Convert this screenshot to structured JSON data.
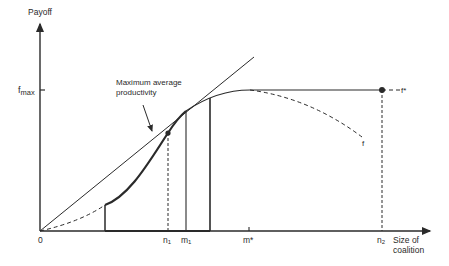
{
  "diagram": {
    "y_axis_label": "Payoff",
    "x_axis_label_line1": "Size of",
    "x_axis_label_line2": "coalition",
    "origin_label": "0",
    "fmax_label": "f",
    "fmax_sub": "max",
    "annotation_line1": "Maximum average",
    "annotation_line2": "productivity",
    "curve_f_label": "f",
    "curve_fstar_label": "f*",
    "x_ticks": {
      "n1": {
        "base": "n",
        "sub": "1"
      },
      "m1": {
        "base": "m",
        "sub": "1"
      },
      "mstar": {
        "base": "m*",
        "sub": ""
      },
      "n2": {
        "base": "n",
        "sub": "2"
      }
    },
    "colors": {
      "ink": "#2a2a2a",
      "background": "#ffffff"
    }
  }
}
